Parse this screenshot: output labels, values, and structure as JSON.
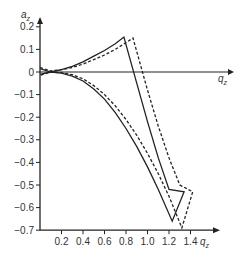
{
  "chart_data": {
    "type": "line",
    "title": "",
    "xlabel": "q_z",
    "ylabel": "a_z",
    "xlim": [
      0,
      1.55
    ],
    "ylim": [
      -0.7,
      0.25
    ],
    "grid": false,
    "legend": null,
    "x_ticks": [
      "0.2",
      "0.4",
      "0.6",
      "0.8",
      "1.0",
      "1.2",
      "1.4"
    ],
    "y_ticks": [
      "0.2",
      "0.1",
      "0",
      "-0.1",
      "-0.2",
      "-0.3",
      "-0.4",
      "-0.5",
      "-0.6",
      "-0.7"
    ],
    "series": [
      {
        "name": "solid",
        "style": "solid",
        "color": "#222222",
        "points": [
          [
            0.0,
            0.015
          ],
          [
            0.1,
            0.0
          ],
          [
            0.2,
            0.01
          ],
          [
            0.3,
            0.025
          ],
          [
            0.4,
            0.045
          ],
          [
            0.5,
            0.07
          ],
          [
            0.6,
            0.095
          ],
          [
            0.7,
            0.125
          ],
          [
            0.78,
            0.155
          ],
          [
            0.9,
            -0.05
          ],
          [
            1.0,
            -0.22
          ],
          [
            1.1,
            -0.38
          ],
          [
            1.2,
            -0.52
          ],
          [
            1.34,
            -0.53
          ],
          [
            1.23,
            -0.66
          ],
          [
            1.1,
            -0.52
          ],
          [
            1.0,
            -0.42
          ],
          [
            0.9,
            -0.33
          ],
          [
            0.8,
            -0.25
          ],
          [
            0.7,
            -0.18
          ],
          [
            0.6,
            -0.12
          ],
          [
            0.5,
            -0.075
          ],
          [
            0.4,
            -0.04
          ],
          [
            0.3,
            -0.018
          ],
          [
            0.2,
            -0.005
          ],
          [
            0.1,
            0.0
          ],
          [
            0.0,
            -0.01
          ]
        ]
      },
      {
        "name": "dashed",
        "style": "dashed",
        "color": "#222222",
        "points": [
          [
            0.0,
            0.02
          ],
          [
            0.1,
            0.005
          ],
          [
            0.2,
            0.01
          ],
          [
            0.3,
            0.02
          ],
          [
            0.4,
            0.035
          ],
          [
            0.5,
            0.055
          ],
          [
            0.6,
            0.075
          ],
          [
            0.7,
            0.1
          ],
          [
            0.8,
            0.13
          ],
          [
            0.865,
            0.15
          ],
          [
            1.0,
            -0.08
          ],
          [
            1.1,
            -0.24
          ],
          [
            1.2,
            -0.38
          ],
          [
            1.3,
            -0.5
          ],
          [
            1.42,
            -0.53
          ],
          [
            1.32,
            -0.69
          ],
          [
            1.2,
            -0.55
          ],
          [
            1.1,
            -0.45
          ],
          [
            1.0,
            -0.36
          ],
          [
            0.9,
            -0.28
          ],
          [
            0.8,
            -0.21
          ],
          [
            0.7,
            -0.15
          ],
          [
            0.6,
            -0.1
          ],
          [
            0.5,
            -0.06
          ],
          [
            0.4,
            -0.03
          ],
          [
            0.3,
            -0.012
          ],
          [
            0.2,
            -0.003
          ],
          [
            0.1,
            0.0
          ],
          [
            0.0,
            -0.015
          ]
        ]
      }
    ]
  },
  "labels": {
    "ylabel": "a",
    "ylabel_sub": "z",
    "xlabel_upper": "q",
    "xlabel_upper_sub": "z",
    "xlabel_lower": "q",
    "xlabel_lower_sub": "z"
  }
}
